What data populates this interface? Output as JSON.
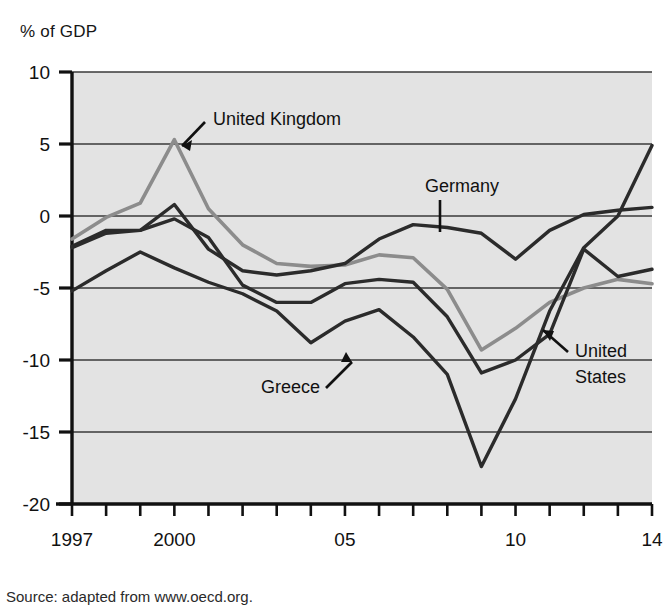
{
  "chart_data": {
    "type": "line",
    "title": "",
    "ylabel": "% of GDP",
    "xlabel": "",
    "ylim": [
      -20,
      10
    ],
    "yticks": [
      10,
      5,
      0,
      -5,
      -10,
      -15,
      -20
    ],
    "ytick_labels": [
      "10",
      "5",
      "0",
      "-5",
      "-10",
      "-15",
      "-20"
    ],
    "xlim": [
      1997,
      2014
    ],
    "x": [
      1997,
      1998,
      1999,
      2000,
      2001,
      2002,
      2003,
      2004,
      2005,
      2006,
      2007,
      2008,
      2009,
      2010,
      2011,
      2012,
      2013,
      2014
    ],
    "xtick_labels": [
      "1997",
      "2000",
      "05",
      "10",
      "14"
    ],
    "xtick_values": [
      1997,
      2000,
      2005,
      2010,
      2014
    ],
    "grid": true,
    "legend_position": "inline-annotations",
    "plot_background": "#e3e3e3",
    "series": [
      {
        "name": "United Kingdom",
        "color": "#8c8c8c",
        "values": [
          -1.6,
          -0.1,
          0.9,
          5.3,
          0.5,
          -2.0,
          -3.3,
          -3.5,
          -3.4,
          -2.7,
          -2.9,
          -5.1,
          -9.3,
          -7.8,
          -6.0,
          -5.0,
          -4.4,
          -4.7
        ]
      },
      {
        "name": "Germany",
        "color": "#2b2b2b",
        "values": [
          -2.1,
          -1.0,
          -1.0,
          0.8,
          -2.3,
          -3.8,
          -4.1,
          -3.8,
          -3.3,
          -1.6,
          -0.6,
          -0.8,
          -1.2,
          -3.0,
          -1.0,
          0.1,
          0.4,
          0.6
        ]
      },
      {
        "name": "United States",
        "color": "#2b2b2b",
        "values": [
          -2.2,
          -1.2,
          -1.0,
          -0.2,
          -1.5,
          -4.8,
          -6.0,
          -6.0,
          -4.7,
          -4.4,
          -4.6,
          -7.0,
          -10.9,
          -10.0,
          -8.2,
          -2.3,
          -4.2,
          -3.7
        ]
      },
      {
        "name": "Greece",
        "color": "#2b2b2b",
        "values": [
          -5.2,
          -3.8,
          -2.5,
          -3.6,
          -4.6,
          -5.4,
          -6.6,
          -8.8,
          -7.3,
          -6.5,
          -8.4,
          -11.0,
          -17.4,
          -12.7,
          -6.6,
          -2.2,
          0.0,
          4.9
        ]
      }
    ],
    "annotations": [
      {
        "label": "United Kingdom",
        "series": "United Kingdom",
        "x_px": 213,
        "y_px": 125,
        "leader": "arrow-down-left"
      },
      {
        "label": "Germany",
        "series": "Germany",
        "x_px": 425,
        "y_px": 192,
        "leader": "line-down"
      },
      {
        "label": "United",
        "series": "United States",
        "x_px": 575,
        "y_px": 357,
        "leader": "arrow-down-left"
      },
      {
        "label": "States",
        "series": "United States",
        "x_px": 575,
        "y_px": 383,
        "leader": "none"
      },
      {
        "label": "Greece",
        "series": "Greece",
        "x_px": 320,
        "y_px": 393,
        "leader": "arrow-up-right"
      }
    ]
  },
  "axis_title": "% of GDP",
  "source": "Source: adapted from www.oecd.org."
}
